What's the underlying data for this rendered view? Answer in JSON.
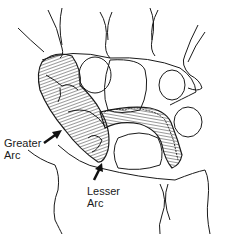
{
  "diagram": {
    "labels": {
      "greater_arc": "Greater\nArc",
      "lesser_arc": "Lesser\nArc"
    },
    "colors": {
      "line": "#1a1a1a",
      "background": "#ffffff",
      "hatch": "#333333"
    }
  }
}
